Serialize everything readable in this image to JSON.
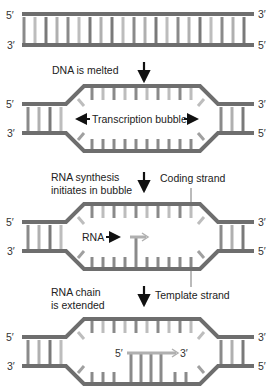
{
  "colors": {
    "backbone": "#6e6e6e",
    "base_dark": "#7a7a7a",
    "base_light": "#b4b4b4",
    "rna": "#a9a9a9",
    "arrow": "#111111",
    "text": "#222222"
  },
  "panels": [
    {
      "id": "panel-1",
      "top_left_end": "5′",
      "bottom_left_end": "3′",
      "top_right_end": "3′",
      "bottom_right_end": "5′"
    },
    {
      "id": "panel-2",
      "top_left_end": "5′",
      "bottom_left_end": "3′",
      "top_right_end": "3′",
      "bottom_right_end": "5′",
      "bubble_label": "Transcription bubble"
    },
    {
      "id": "panel-3",
      "top_left_end": "5′",
      "bottom_left_end": "3′",
      "top_right_end": "3′",
      "bottom_right_end": "5′",
      "rna_label": "RNA"
    },
    {
      "id": "panel-4",
      "top_left_end": "5′",
      "bottom_left_end": "3′",
      "top_right_end": "3′",
      "bottom_right_end": "5′",
      "rna_start": "5′",
      "rna_end": "3′"
    }
  ],
  "steps": [
    {
      "label_lines": [
        "DNA is melted"
      ]
    },
    {
      "label_lines": [
        "RNA synthesis",
        "initiates in bubble"
      ],
      "callout": "Coding strand"
    },
    {
      "label_lines": [
        "RNA chain",
        "is extended"
      ],
      "callout": "Template strand"
    }
  ]
}
